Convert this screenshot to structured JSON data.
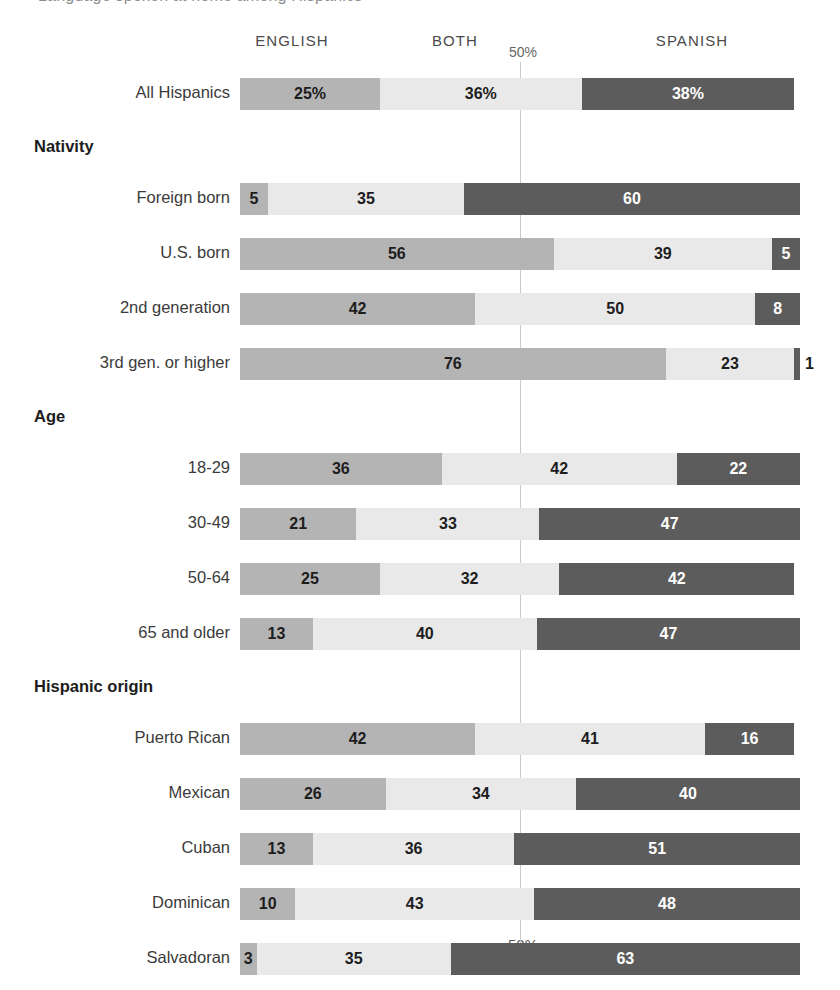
{
  "cut_off_title": "Language spoken at home among Hispanics",
  "legend": {
    "english": "ENGLISH",
    "both": "BOTH",
    "spanish": "SPANISH"
  },
  "axis": {
    "top_tick_label": "50%",
    "bottom_tick_label": "50%"
  },
  "colors": {
    "english": "#b4b4b4",
    "both": "#e9e9e9",
    "spanish": "#5c5c5c",
    "guide": "#c9c9c9"
  },
  "chart_data": {
    "type": "bar",
    "orientation": "horizontal",
    "stacked": true,
    "title": "Language spoken at home among Hispanics",
    "xlabel": "",
    "ylabel": "",
    "xlim": [
      0,
      100
    ],
    "grid": false,
    "legend_position": "top",
    "axis_ticks": [
      "50%"
    ],
    "series": [
      {
        "name": "ENGLISH",
        "color": "#b4b4b4"
      },
      {
        "name": "BOTH",
        "color": "#e9e9e9"
      },
      {
        "name": "SPANISH",
        "color": "#5c5c5c"
      }
    ],
    "rows": [
      {
        "kind": "bar",
        "label": "All Hispanics",
        "indent": 0,
        "english": 25,
        "both": 36,
        "spanish": 38,
        "english_label": "25%",
        "both_label": "36%",
        "spanish_label": "38%"
      },
      {
        "kind": "group",
        "label": "Nativity"
      },
      {
        "kind": "bar",
        "label": "Foreign born",
        "indent": 0,
        "english": 5,
        "both": 35,
        "spanish": 60,
        "english_label": "5",
        "both_label": "35",
        "spanish_label": "60"
      },
      {
        "kind": "bar",
        "label": "U.S. born",
        "indent": 0,
        "english": 56,
        "both": 39,
        "spanish": 5,
        "english_label": "56",
        "both_label": "39",
        "spanish_label": "5"
      },
      {
        "kind": "bar",
        "label": "2nd generation",
        "indent": 1,
        "english": 42,
        "both": 50,
        "spanish": 8,
        "english_label": "42",
        "both_label": "50",
        "spanish_label": "8"
      },
      {
        "kind": "bar",
        "label": "3rd gen. or higher",
        "indent": 1,
        "english": 76,
        "both": 23,
        "spanish": 1,
        "english_label": "76",
        "both_label": "23",
        "spanish_label": "1",
        "spanish_label_outside": true
      },
      {
        "kind": "group",
        "label": "Age"
      },
      {
        "kind": "bar",
        "label": "18-29",
        "indent": 0,
        "english": 36,
        "both": 42,
        "spanish": 22,
        "english_label": "36",
        "both_label": "42",
        "spanish_label": "22"
      },
      {
        "kind": "bar",
        "label": "30-49",
        "indent": 0,
        "english": 21,
        "both": 33,
        "spanish": 47,
        "english_label": "21",
        "both_label": "33",
        "spanish_label": "47"
      },
      {
        "kind": "bar",
        "label": "50-64",
        "indent": 0,
        "english": 25,
        "both": 32,
        "spanish": 42,
        "english_label": "25",
        "both_label": "32",
        "spanish_label": "42"
      },
      {
        "kind": "bar",
        "label": "65 and older",
        "indent": 0,
        "english": 13,
        "both": 40,
        "spanish": 47,
        "english_label": "13",
        "both_label": "40",
        "spanish_label": "47"
      },
      {
        "kind": "group",
        "label": "Hispanic origin"
      },
      {
        "kind": "bar",
        "label": "Puerto Rican",
        "indent": 0,
        "english": 42,
        "both": 41,
        "spanish": 16,
        "english_label": "42",
        "both_label": "41",
        "spanish_label": "16"
      },
      {
        "kind": "bar",
        "label": "Mexican",
        "indent": 0,
        "english": 26,
        "both": 34,
        "spanish": 40,
        "english_label": "26",
        "both_label": "34",
        "spanish_label": "40"
      },
      {
        "kind": "bar",
        "label": "Cuban",
        "indent": 0,
        "english": 13,
        "both": 36,
        "spanish": 51,
        "english_label": "13",
        "both_label": "36",
        "spanish_label": "51"
      },
      {
        "kind": "bar",
        "label": "Dominican",
        "indent": 0,
        "english": 10,
        "both": 43,
        "spanish": 48,
        "english_label": "10",
        "both_label": "43",
        "spanish_label": "48"
      },
      {
        "kind": "bar",
        "label": "Salvadoran",
        "indent": 0,
        "english": 3,
        "both": 35,
        "spanish": 63,
        "english_label": "3",
        "both_label": "35",
        "spanish_label": "63"
      }
    ]
  }
}
